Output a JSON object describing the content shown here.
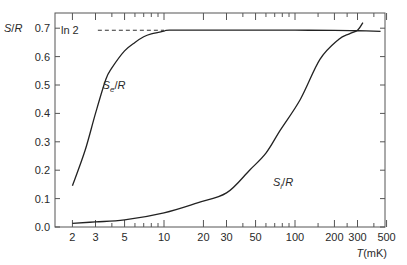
{
  "chart_data": {
    "type": "line",
    "title": "",
    "xlabel": "T (mK)",
    "ylabel": "S/R",
    "xscale": "log",
    "xlim": [
      1.75,
      500
    ],
    "ylim": [
      0.0,
      0.75
    ],
    "x_ticks": [
      2,
      3,
      5,
      10,
      20,
      30,
      50,
      100,
      200,
      300,
      500
    ],
    "x_tick_labels": [
      "2",
      "3",
      "5",
      "10",
      "20",
      "30",
      "50",
      "100",
      "200",
      "300",
      "500"
    ],
    "y_ticks": [
      0.0,
      0.1,
      0.2,
      0.3,
      0.4,
      0.5,
      0.6,
      0.7
    ],
    "y_tick_labels": [
      "0.0",
      "0.1",
      "0.2",
      "0.3",
      "0.4",
      "0.5",
      "0.6",
      "0.7"
    ],
    "grid": false,
    "legend": null,
    "annotations": [
      {
        "text": "ln 2",
        "x": 2.1,
        "y": 0.693,
        "note": "dashed horizontal reference line at ln 2 ≈ 0.693"
      },
      {
        "text": "Se/R",
        "x": 3.4,
        "y": 0.5
      },
      {
        "text": "Si/R",
        "x": 55,
        "y": 0.16
      }
    ],
    "series": [
      {
        "name": "Se/R",
        "x": [
          2,
          2.5,
          3,
          3.6,
          4,
          5,
          6,
          7,
          8,
          10,
          11,
          20,
          50,
          100,
          200,
          300,
          450
        ],
        "y": [
          0.145,
          0.27,
          0.4,
          0.52,
          0.56,
          0.62,
          0.65,
          0.67,
          0.68,
          0.69,
          0.693,
          0.693,
          0.693,
          0.693,
          0.692,
          0.691,
          0.689
        ]
      },
      {
        "name": "Si/R",
        "x": [
          2,
          3,
          5,
          10,
          18,
          30,
          45,
          60,
          77,
          110,
          155,
          215,
          260,
          300,
          330
        ],
        "y": [
          0.013,
          0.018,
          0.025,
          0.05,
          0.085,
          0.12,
          0.2,
          0.26,
          0.34,
          0.45,
          0.59,
          0.66,
          0.68,
          0.693,
          0.72
        ]
      }
    ],
    "reference_line": {
      "label": "ln 2",
      "y": 0.693,
      "x_from": 2.2,
      "x_to": 10
    }
  }
}
